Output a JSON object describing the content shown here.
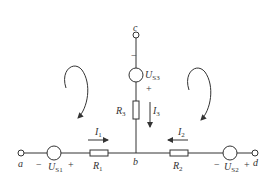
{
  "diagram": {
    "type": "circuit",
    "nodes": {
      "a": "a",
      "b": "b",
      "c": "c",
      "d": "d"
    },
    "sources": {
      "us1": {
        "name": "U",
        "sub": "S1",
        "minus": "−",
        "plus": "+"
      },
      "us2": {
        "name": "U",
        "sub": "S2",
        "minus": "−",
        "plus": "+"
      },
      "us3": {
        "name": "U",
        "sub": "S3",
        "minus": "−",
        "plus": "+"
      }
    },
    "resistors": {
      "r1": {
        "name": "R",
        "sub": "1"
      },
      "r2": {
        "name": "R",
        "sub": "2"
      },
      "r3": {
        "name": "R",
        "sub": "3"
      }
    },
    "currents": {
      "i1": {
        "name": "I",
        "sub": "1",
        "direction": "right"
      },
      "i2": {
        "name": "I",
        "sub": "2",
        "direction": "left"
      },
      "i3": {
        "name": "I",
        "sub": "3",
        "direction": "down"
      }
    },
    "loops": [
      {
        "id": "left-loop",
        "direction": "clockwise"
      },
      {
        "id": "right-loop",
        "direction": "clockwise"
      }
    ],
    "colors": {
      "line": "#333333",
      "background": "#ffffff"
    }
  }
}
